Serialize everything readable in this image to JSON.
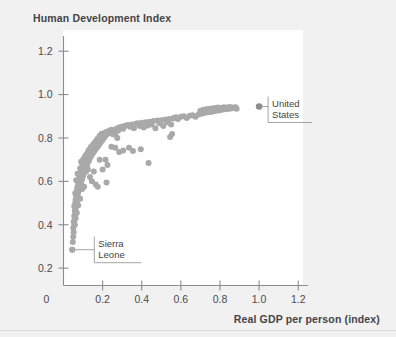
{
  "chart_data": {
    "type": "scatter",
    "title": "Human Development Index",
    "xlabel": "Real GDP per person (index)",
    "ylabel": "Human Development Index",
    "xlim": [
      0,
      1.25
    ],
    "ylim": [
      0.12,
      1.27
    ],
    "grid": false,
    "legend": null,
    "xticks": [
      "0",
      "0.2",
      "0.4",
      "0.6",
      "0.8",
      "1.0",
      "1.2"
    ],
    "xtick_values": [
      0,
      0.2,
      0.4,
      0.6,
      0.8,
      1.0,
      1.2
    ],
    "yticks": [
      "0.2",
      "0.4",
      "0.6",
      "0.8",
      "1.0",
      "1.2"
    ],
    "ytick_values": [
      0.2,
      0.4,
      0.6,
      0.8,
      1.0,
      1.2
    ],
    "point_color": "#a9a9aa",
    "highlight_color": "#8d8d8f",
    "series": [
      {
        "name": "Countries",
        "points": [
          [
            0.045,
            0.285
          ],
          [
            0.048,
            0.32
          ],
          [
            0.05,
            0.345
          ],
          [
            0.052,
            0.365
          ],
          [
            0.05,
            0.385
          ],
          [
            0.055,
            0.4
          ],
          [
            0.052,
            0.415
          ],
          [
            0.058,
            0.425
          ],
          [
            0.055,
            0.44
          ],
          [
            0.06,
            0.45
          ],
          [
            0.058,
            0.465
          ],
          [
            0.062,
            0.475
          ],
          [
            0.055,
            0.485
          ],
          [
            0.065,
            0.49
          ],
          [
            0.06,
            0.5
          ],
          [
            0.068,
            0.505
          ],
          [
            0.062,
            0.515
          ],
          [
            0.07,
            0.52
          ],
          [
            0.065,
            0.53
          ],
          [
            0.072,
            0.535
          ],
          [
            0.06,
            0.545
          ],
          [
            0.075,
            0.55
          ],
          [
            0.068,
            0.555
          ],
          [
            0.08,
            0.56
          ],
          [
            0.07,
            0.57
          ],
          [
            0.085,
            0.575
          ],
          [
            0.075,
            0.585
          ],
          [
            0.09,
            0.59
          ],
          [
            0.078,
            0.6
          ],
          [
            0.065,
            0.605
          ],
          [
            0.095,
            0.61
          ],
          [
            0.082,
            0.62
          ],
          [
            0.1,
            0.625
          ],
          [
            0.088,
            0.63
          ],
          [
            0.072,
            0.635
          ],
          [
            0.105,
            0.64
          ],
          [
            0.092,
            0.645
          ],
          [
            0.11,
            0.65
          ],
          [
            0.098,
            0.655
          ],
          [
            0.085,
            0.66
          ],
          [
            0.115,
            0.665
          ],
          [
            0.102,
            0.67
          ],
          [
            0.12,
            0.675
          ],
          [
            0.108,
            0.68
          ],
          [
            0.095,
            0.685
          ],
          [
            0.125,
            0.688
          ],
          [
            0.112,
            0.692
          ],
          [
            0.13,
            0.695
          ],
          [
            0.118,
            0.7
          ],
          [
            0.105,
            0.705
          ],
          [
            0.135,
            0.708
          ],
          [
            0.122,
            0.712
          ],
          [
            0.14,
            0.715
          ],
          [
            0.128,
            0.718
          ],
          [
            0.115,
            0.722
          ],
          [
            0.145,
            0.725
          ],
          [
            0.132,
            0.728
          ],
          [
            0.15,
            0.73
          ],
          [
            0.138,
            0.733
          ],
          [
            0.125,
            0.736
          ],
          [
            0.155,
            0.738
          ],
          [
            0.142,
            0.74
          ],
          [
            0.16,
            0.742
          ],
          [
            0.148,
            0.745
          ],
          [
            0.135,
            0.748
          ],
          [
            0.165,
            0.75
          ],
          [
            0.152,
            0.752
          ],
          [
            0.17,
            0.755
          ],
          [
            0.158,
            0.757
          ],
          [
            0.145,
            0.76
          ],
          [
            0.175,
            0.762
          ],
          [
            0.162,
            0.765
          ],
          [
            0.18,
            0.767
          ],
          [
            0.168,
            0.77
          ],
          [
            0.155,
            0.772
          ],
          [
            0.185,
            0.775
          ],
          [
            0.172,
            0.777
          ],
          [
            0.19,
            0.78
          ],
          [
            0.178,
            0.782
          ],
          [
            0.165,
            0.785
          ],
          [
            0.195,
            0.787
          ],
          [
            0.182,
            0.79
          ],
          [
            0.2,
            0.792
          ],
          [
            0.188,
            0.795
          ],
          [
            0.175,
            0.797
          ],
          [
            0.205,
            0.8
          ],
          [
            0.192,
            0.802
          ],
          [
            0.21,
            0.805
          ],
          [
            0.198,
            0.807
          ],
          [
            0.185,
            0.81
          ],
          [
            0.215,
            0.812
          ],
          [
            0.202,
            0.814
          ],
          [
            0.22,
            0.816
          ],
          [
            0.208,
            0.818
          ],
          [
            0.195,
            0.82
          ],
          [
            0.225,
            0.822
          ],
          [
            0.212,
            0.824
          ],
          [
            0.23,
            0.826
          ],
          [
            0.218,
            0.828
          ],
          [
            0.24,
            0.83
          ],
          [
            0.25,
            0.832
          ],
          [
            0.235,
            0.834
          ],
          [
            0.26,
            0.836
          ],
          [
            0.245,
            0.838
          ],
          [
            0.27,
            0.84
          ],
          [
            0.255,
            0.826
          ],
          [
            0.265,
            0.815
          ],
          [
            0.275,
            0.845
          ],
          [
            0.285,
            0.848
          ],
          [
            0.295,
            0.85
          ],
          [
            0.28,
            0.835
          ],
          [
            0.3,
            0.852
          ],
          [
            0.31,
            0.855
          ],
          [
            0.32,
            0.858
          ],
          [
            0.305,
            0.842
          ],
          [
            0.33,
            0.86
          ],
          [
            0.34,
            0.852
          ],
          [
            0.35,
            0.862
          ],
          [
            0.36,
            0.845
          ],
          [
            0.37,
            0.865
          ],
          [
            0.38,
            0.868
          ],
          [
            0.39,
            0.855
          ],
          [
            0.4,
            0.87
          ],
          [
            0.41,
            0.848
          ],
          [
            0.42,
            0.872
          ],
          [
            0.43,
            0.858
          ],
          [
            0.44,
            0.875
          ],
          [
            0.45,
            0.862
          ],
          [
            0.46,
            0.878
          ],
          [
            0.47,
            0.845
          ],
          [
            0.48,
            0.88
          ],
          [
            0.49,
            0.868
          ],
          [
            0.5,
            0.882
          ],
          [
            0.51,
            0.855
          ],
          [
            0.52,
            0.885
          ],
          [
            0.53,
            0.872
          ],
          [
            0.54,
            0.888
          ],
          [
            0.55,
            0.862
          ],
          [
            0.56,
            0.89
          ],
          [
            0.545,
            0.805
          ],
          [
            0.555,
            0.818
          ],
          [
            0.565,
            0.892
          ],
          [
            0.575,
            0.895
          ],
          [
            0.585,
            0.888
          ],
          [
            0.6,
            0.898
          ],
          [
            0.615,
            0.9
          ],
          [
            0.63,
            0.892
          ],
          [
            0.645,
            0.902
          ],
          [
            0.66,
            0.905
          ],
          [
            0.675,
            0.898
          ],
          [
            0.69,
            0.908
          ],
          [
            0.7,
            0.925
          ],
          [
            0.705,
            0.912
          ],
          [
            0.715,
            0.93
          ],
          [
            0.72,
            0.915
          ],
          [
            0.73,
            0.932
          ],
          [
            0.735,
            0.918
          ],
          [
            0.745,
            0.935
          ],
          [
            0.75,
            0.92
          ],
          [
            0.76,
            0.936
          ],
          [
            0.765,
            0.922
          ],
          [
            0.775,
            0.938
          ],
          [
            0.78,
            0.925
          ],
          [
            0.79,
            0.94
          ],
          [
            0.795,
            0.927
          ],
          [
            0.805,
            0.938
          ],
          [
            0.81,
            0.93
          ],
          [
            0.82,
            0.942
          ],
          [
            0.825,
            0.932
          ],
          [
            0.835,
            0.94
          ],
          [
            0.84,
            0.934
          ],
          [
            0.85,
            0.943
          ],
          [
            0.855,
            0.936
          ],
          [
            0.865,
            0.941
          ],
          [
            0.87,
            0.938
          ],
          [
            0.88,
            0.942
          ],
          [
            0.885,
            0.935
          ],
          [
            0.135,
            0.62
          ],
          [
            0.145,
            0.6
          ],
          [
            0.155,
            0.645
          ],
          [
            0.165,
            0.585
          ],
          [
            0.175,
            0.575
          ],
          [
            0.185,
            0.7
          ],
          [
            0.2,
            0.655
          ],
          [
            0.215,
            0.7
          ],
          [
            0.225,
            0.675
          ],
          [
            0.245,
            0.76
          ],
          [
            0.265,
            0.755
          ],
          [
            0.285,
            0.735
          ],
          [
            0.305,
            0.742
          ],
          [
            0.335,
            0.755
          ],
          [
            0.355,
            0.74
          ],
          [
            0.395,
            0.748
          ],
          [
            0.435,
            0.685
          ],
          [
            0.22,
            0.595
          ],
          [
            0.095,
            0.565
          ],
          [
            0.105,
            0.575
          ],
          [
            0.115,
            0.645
          ],
          [
            0.125,
            0.655
          ],
          [
            0.085,
            0.52
          ],
          [
            0.075,
            0.49
          ],
          [
            0.068,
            0.455
          ],
          [
            0.062,
            0.43
          ],
          [
            0.058,
            0.4
          ],
          [
            0.09,
            0.69
          ],
          [
            0.1,
            0.7
          ],
          [
            0.11,
            0.715
          ],
          [
            0.12,
            0.722
          ],
          [
            0.13,
            0.745
          ],
          [
            0.14,
            0.758
          ],
          [
            0.15,
            0.768
          ],
          [
            0.16,
            0.778
          ],
          [
            0.17,
            0.788
          ],
          [
            0.18,
            0.798
          ],
          [
            0.19,
            0.808
          ],
          [
            0.21,
            0.818
          ],
          [
            0.23,
            0.826
          ],
          [
            0.25,
            0.818
          ],
          [
            0.275,
            0.8
          ]
        ]
      }
    ],
    "annotations": [
      {
        "label": "United States",
        "lines": [
          "United",
          "States"
        ],
        "point": [
          1.0,
          0.945
        ],
        "marker": true
      },
      {
        "label": "Sierra Leone",
        "lines": [
          "Sierra",
          "Leone"
        ],
        "point": [
          0.045,
          0.285
        ],
        "marker": false
      }
    ]
  }
}
